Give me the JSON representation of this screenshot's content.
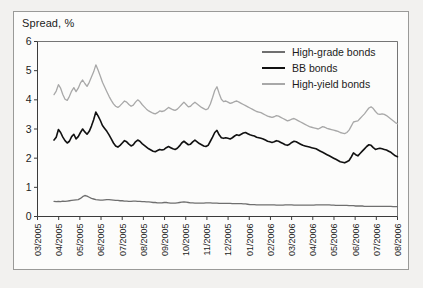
{
  "figure": {
    "background": "#f2f1ef",
    "panel_background": "#fcfcfb",
    "border_color": "#9a9a98"
  },
  "chart_data": {
    "type": "line",
    "title": "",
    "ylabel": "Spread, %",
    "xlabel": "",
    "ylim": [
      0,
      6
    ],
    "yticks": [
      0,
      1,
      2,
      3,
      4,
      5,
      6
    ],
    "ytick_labels": [
      "0",
      "1",
      "2",
      "3",
      "4",
      "5",
      "6"
    ],
    "grid": false,
    "legend_position": "top-right",
    "x_tick_labels": [
      "03/2005",
      "04/2005",
      "05/2005",
      "06/2005",
      "07/2005",
      "08/2005",
      "09/2005",
      "10/2005",
      "11/2005",
      "12/2005",
      "01/2006",
      "02/2006",
      "03/2006",
      "04/2006",
      "05/2006",
      "06/2006",
      "07/2006",
      "08/2006"
    ],
    "x_range": [
      "03/2005",
      "08/2006"
    ],
    "series": [
      {
        "name": "High-grade bonds",
        "color": "#6f6f6f",
        "width": 1.3,
        "values": [
          0.52,
          0.51,
          0.52,
          0.51,
          0.53,
          0.52,
          0.53,
          0.54,
          0.55,
          0.56,
          0.57,
          0.58,
          0.62,
          0.68,
          0.72,
          0.7,
          0.66,
          0.62,
          0.6,
          0.58,
          0.57,
          0.56,
          0.56,
          0.57,
          0.58,
          0.58,
          0.57,
          0.56,
          0.55,
          0.55,
          0.54,
          0.54,
          0.53,
          0.53,
          0.52,
          0.52,
          0.53,
          0.53,
          0.52,
          0.52,
          0.51,
          0.51,
          0.5,
          0.5,
          0.49,
          0.48,
          0.48,
          0.47,
          0.47,
          0.47,
          0.48,
          0.48,
          0.47,
          0.46,
          0.46,
          0.46,
          0.47,
          0.48,
          0.49,
          0.5,
          0.49,
          0.48,
          0.47,
          0.47,
          0.46,
          0.46,
          0.46,
          0.46,
          0.46,
          0.47,
          0.47,
          0.47,
          0.46,
          0.46,
          0.46,
          0.45,
          0.45,
          0.45,
          0.45,
          0.45,
          0.45,
          0.44,
          0.44,
          0.44,
          0.44,
          0.44,
          0.43,
          0.43,
          0.42,
          0.41,
          0.41,
          0.41,
          0.4,
          0.4,
          0.4,
          0.4,
          0.4,
          0.4,
          0.4,
          0.4,
          0.4,
          0.39,
          0.39,
          0.39,
          0.39,
          0.4,
          0.4,
          0.4,
          0.4,
          0.39,
          0.39,
          0.39,
          0.39,
          0.39,
          0.39,
          0.39,
          0.39,
          0.39,
          0.39,
          0.4,
          0.4,
          0.4,
          0.4,
          0.4,
          0.4,
          0.4,
          0.39,
          0.39,
          0.38,
          0.38,
          0.38,
          0.38,
          0.38,
          0.38,
          0.37,
          0.37,
          0.37,
          0.36,
          0.36,
          0.36,
          0.36,
          0.35,
          0.35,
          0.35,
          0.35,
          0.35,
          0.35,
          0.35,
          0.35,
          0.35,
          0.35,
          0.35,
          0.35,
          0.35,
          0.34,
          0.34,
          0.34
        ]
      },
      {
        "name": "BB bonds",
        "color": "#111111",
        "width": 1.6,
        "values": [
          2.62,
          2.72,
          2.98,
          2.88,
          2.72,
          2.6,
          2.52,
          2.58,
          2.74,
          2.82,
          2.66,
          2.74,
          2.88,
          3.0,
          2.9,
          2.82,
          2.92,
          3.1,
          3.32,
          3.58,
          3.45,
          3.3,
          3.12,
          3.02,
          2.92,
          2.8,
          2.66,
          2.52,
          2.42,
          2.38,
          2.44,
          2.52,
          2.6,
          2.56,
          2.48,
          2.42,
          2.46,
          2.56,
          2.62,
          2.58,
          2.5,
          2.44,
          2.38,
          2.32,
          2.28,
          2.24,
          2.22,
          2.26,
          2.3,
          2.28,
          2.3,
          2.36,
          2.4,
          2.36,
          2.32,
          2.3,
          2.34,
          2.42,
          2.52,
          2.58,
          2.52,
          2.46,
          2.48,
          2.56,
          2.62,
          2.56,
          2.5,
          2.46,
          2.42,
          2.4,
          2.44,
          2.58,
          2.72,
          2.88,
          2.95,
          2.8,
          2.7,
          2.68,
          2.7,
          2.68,
          2.66,
          2.7,
          2.76,
          2.8,
          2.78,
          2.82,
          2.86,
          2.88,
          2.84,
          2.8,
          2.78,
          2.76,
          2.72,
          2.7,
          2.68,
          2.66,
          2.62,
          2.58,
          2.56,
          2.54,
          2.56,
          2.6,
          2.58,
          2.54,
          2.5,
          2.46,
          2.44,
          2.48,
          2.54,
          2.58,
          2.56,
          2.52,
          2.48,
          2.44,
          2.42,
          2.4,
          2.38,
          2.36,
          2.34,
          2.32,
          2.28,
          2.24,
          2.2,
          2.16,
          2.12,
          2.08,
          2.04,
          2.0,
          1.96,
          1.92,
          1.88,
          1.86,
          1.84,
          1.88,
          1.92,
          2.04,
          2.18,
          2.12,
          2.08,
          2.16,
          2.24,
          2.32,
          2.4,
          2.46,
          2.44,
          2.36,
          2.3,
          2.32,
          2.34,
          2.32,
          2.3,
          2.28,
          2.24,
          2.2,
          2.14,
          2.08,
          2.05
        ]
      },
      {
        "name": "High-yield bonds",
        "color": "#a8a8a8",
        "width": 1.3,
        "values": [
          4.18,
          4.3,
          4.52,
          4.4,
          4.18,
          4.02,
          3.98,
          4.12,
          4.3,
          4.42,
          4.28,
          4.4,
          4.58,
          4.68,
          4.56,
          4.46,
          4.6,
          4.78,
          4.96,
          5.2,
          5.02,
          4.82,
          4.6,
          4.44,
          4.28,
          4.12,
          3.98,
          3.86,
          3.78,
          3.74,
          3.8,
          3.88,
          3.96,
          3.92,
          3.84,
          3.78,
          3.82,
          3.92,
          4.0,
          3.94,
          3.84,
          3.76,
          3.68,
          3.62,
          3.58,
          3.54,
          3.52,
          3.56,
          3.62,
          3.6,
          3.62,
          3.68,
          3.74,
          3.7,
          3.66,
          3.64,
          3.68,
          3.76,
          3.84,
          3.92,
          3.84,
          3.76,
          3.78,
          3.86,
          3.92,
          3.86,
          3.8,
          3.74,
          3.7,
          3.66,
          3.7,
          3.86,
          4.08,
          4.32,
          4.45,
          4.22,
          4.02,
          3.94,
          3.96,
          3.92,
          3.88,
          3.9,
          3.94,
          3.96,
          3.92,
          3.88,
          3.84,
          3.8,
          3.76,
          3.72,
          3.68,
          3.64,
          3.6,
          3.58,
          3.56,
          3.52,
          3.48,
          3.44,
          3.42,
          3.4,
          3.42,
          3.46,
          3.44,
          3.4,
          3.36,
          3.32,
          3.28,
          3.3,
          3.34,
          3.36,
          3.32,
          3.28,
          3.24,
          3.2,
          3.16,
          3.12,
          3.08,
          3.06,
          3.04,
          3.02,
          3.0,
          3.04,
          3.08,
          3.06,
          3.02,
          3.0,
          2.98,
          2.96,
          2.94,
          2.92,
          2.88,
          2.86,
          2.84,
          2.88,
          2.96,
          3.1,
          3.24,
          3.26,
          3.28,
          3.36,
          3.44,
          3.52,
          3.62,
          3.72,
          3.76,
          3.7,
          3.6,
          3.52,
          3.5,
          3.52,
          3.5,
          3.46,
          3.4,
          3.34,
          3.28,
          3.22,
          3.18
        ]
      }
    ]
  },
  "legend": {
    "items": [
      {
        "label": "High-grade bonds",
        "color": "#6f6f6f",
        "width": 2.2
      },
      {
        "label": "BB bonds",
        "color": "#111111",
        "width": 2.6
      },
      {
        "label": "High-yield bonds",
        "color": "#a8a8a8",
        "width": 2.0
      }
    ]
  }
}
